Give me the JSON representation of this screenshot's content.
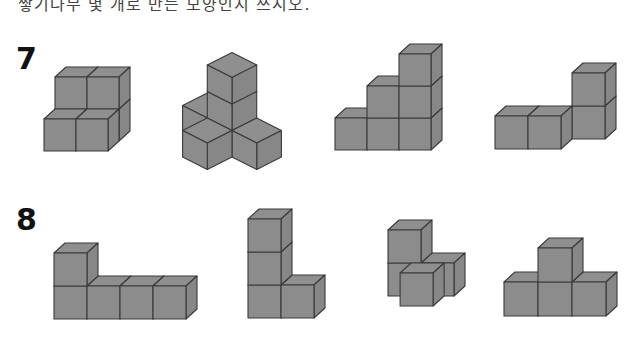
{
  "header": {
    "text": "쌓기나무 몇 개로 만든 모양인지 쓰시오."
  },
  "colors": {
    "face_front": "#8c8c8c",
    "face_top": "#8f8f8f",
    "face_side": "#878787",
    "stroke": "#3a3a3a"
  },
  "problems": [
    {
      "number": "7",
      "label_pos": [
        16,
        44
      ],
      "figures": [
        {
          "name": "figure-7-1",
          "proj": "oblique",
          "origin": [
            44,
            151
          ],
          "s": 32,
          "dx": 11,
          "dy": -10,
          "cubes": [
            [
              0,
              0,
              1
            ],
            [
              1,
              0,
              1
            ],
            [
              0,
              1,
              1
            ],
            [
              1,
              1,
              1
            ],
            [
              0,
              0,
              0
            ],
            [
              1,
              0,
              0
            ]
          ]
        },
        {
          "name": "figure-7-2",
          "proj": "iso",
          "origin": [
            232,
            132
          ],
          "s": 26,
          "cubes": [
            [
              0,
              0,
              0
            ],
            [
              0,
              1,
              0
            ],
            [
              0,
              2,
              0
            ],
            [
              1,
              0,
              0
            ],
            [
              0,
              0,
              1
            ],
            [
              -1,
              0,
              0
            ]
          ]
        },
        {
          "name": "figure-7-3",
          "proj": "oblique",
          "origin": [
            335,
            150
          ],
          "s": 32,
          "dx": 11,
          "dy": -10,
          "cubes": [
            [
              0,
              0,
              0
            ],
            [
              1,
              0,
              0
            ],
            [
              2,
              0,
              0
            ],
            [
              1,
              1,
              0
            ],
            [
              2,
              1,
              0
            ],
            [
              2,
              2,
              0
            ]
          ]
        },
        {
          "name": "figure-7-4",
          "proj": "oblique",
          "origin": [
            495,
            149
          ],
          "s": 33,
          "dx": 11,
          "dy": -10,
          "cubes": [
            [
              0,
              0,
              0
            ],
            [
              1,
              0,
              0
            ],
            [
              2,
              0,
              1
            ],
            [
              2,
              1,
              1
            ]
          ]
        }
      ]
    },
    {
      "number": "8",
      "label_pos": [
        16,
        205
      ],
      "figures": [
        {
          "name": "figure-8-1",
          "proj": "oblique",
          "origin": [
            54,
            319
          ],
          "s": 33,
          "dx": 11,
          "dy": -10,
          "cubes": [
            [
              0,
              0,
              0
            ],
            [
              0,
              1,
              0
            ],
            [
              1,
              0,
              0
            ],
            [
              2,
              0,
              0
            ],
            [
              3,
              0,
              0
            ]
          ]
        },
        {
          "name": "figure-8-2",
          "proj": "oblique",
          "origin": [
            248,
            318
          ],
          "s": 33,
          "dx": 11,
          "dy": -10,
          "cubes": [
            [
              0,
              0,
              0
            ],
            [
              0,
              1,
              0
            ],
            [
              0,
              2,
              0
            ],
            [
              1,
              0,
              0
            ]
          ]
        },
        {
          "name": "figure-8-3",
          "proj": "oblique",
          "origin": [
            377,
            306
          ],
          "s": 33,
          "dx": 11,
          "dy": -10,
          "cubes": [
            [
              0,
              0,
              1
            ],
            [
              0,
              1,
              1
            ],
            [
              1,
              0,
              1
            ],
            [
              0.7,
              0,
              0
            ]
          ]
        },
        {
          "name": "figure-8-4",
          "proj": "oblique",
          "origin": [
            504,
            316
          ],
          "s": 34,
          "dx": 11,
          "dy": -10,
          "cubes": [
            [
              0,
              0,
              0
            ],
            [
              1,
              0,
              0
            ],
            [
              2,
              0,
              0
            ],
            [
              1,
              1,
              0
            ]
          ]
        }
      ]
    }
  ]
}
